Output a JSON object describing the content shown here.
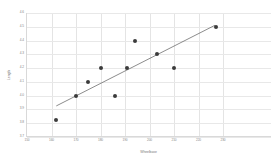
{
  "chart_data": {
    "type": "scatter",
    "title": "",
    "xlabel": "Wheelbase",
    "ylabel": "Length",
    "xlim": [
      150,
      250
    ],
    "ylim": [
      3.7,
      4.6
    ],
    "xticks": [
      150,
      160,
      170,
      180,
      190,
      200,
      210,
      220,
      230
    ],
    "yticks": [
      3.7,
      3.8,
      3.9,
      4.0,
      4.1,
      4.2,
      4.3,
      4.4,
      4.5,
      4.6
    ],
    "xtick_labels": [
      "150",
      "160",
      "170",
      "180",
      "190",
      "200",
      "210",
      "220",
      "230"
    ],
    "ytick_labels": [
      "3.7",
      "3.8",
      "3.9",
      "4.0",
      "4.1",
      "4.2",
      "4.3",
      "4.4",
      "4.5",
      "4.6"
    ],
    "grid": true,
    "legend": "none",
    "points": [
      {
        "x": 162,
        "y": 3.82
      },
      {
        "x": 170,
        "y": 4.0
      },
      {
        "x": 175,
        "y": 4.1
      },
      {
        "x": 180,
        "y": 4.2
      },
      {
        "x": 186,
        "y": 4.0
      },
      {
        "x": 191,
        "y": 4.2
      },
      {
        "x": 194,
        "y": 4.4
      },
      {
        "x": 203,
        "y": 4.3
      },
      {
        "x": 210,
        "y": 4.2
      },
      {
        "x": 227,
        "y": 4.5
      }
    ],
    "series": [
      {
        "name": "observations",
        "marker": "circle",
        "color": "#3b3b3b",
        "x": [
          162,
          170,
          175,
          180,
          186,
          191,
          194,
          203,
          210,
          227
        ],
        "values": [
          3.82,
          4.0,
          4.1,
          4.2,
          4.0,
          4.2,
          4.4,
          4.3,
          4.2,
          4.5
        ]
      },
      {
        "name": "trend-line",
        "type": "line",
        "color": "#5a5a5a",
        "x": [
          162,
          227
        ],
        "values": [
          3.92,
          4.51
        ]
      }
    ],
    "colors": {
      "marker": "#3b3b3b",
      "trendline": "#5a5a5a",
      "grid": "#e6e6e6",
      "axis": "#d9d9d9",
      "ticklabel": "#888888",
      "axislabel": "#7a7a7a",
      "background": "#ffffff"
    }
  }
}
